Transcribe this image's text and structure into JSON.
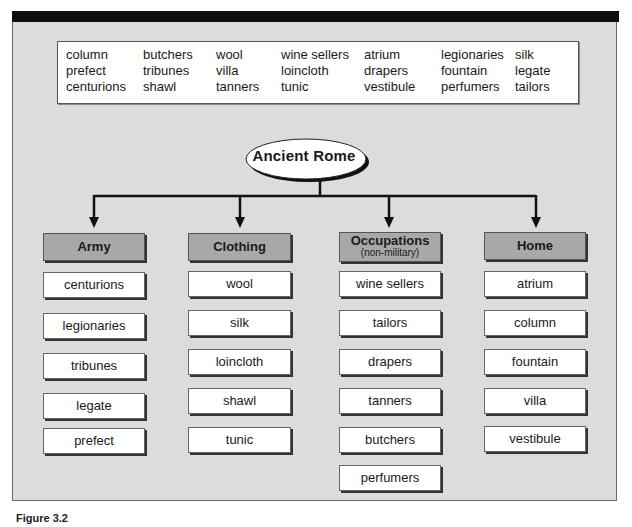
{
  "diagram": {
    "root": {
      "label": "Ancient Rome"
    },
    "word_bank": {
      "columns": [
        [
          "column",
          "prefect",
          "centurions"
        ],
        [
          "butchers",
          "tribunes",
          "shawl"
        ],
        [
          "wool",
          "villa",
          "tanners"
        ],
        [
          "wine sellers",
          "loincloth",
          "tunic"
        ],
        [
          "atrium",
          "drapers",
          "vestibule"
        ],
        [
          "legionaries",
          "fountain",
          "perfumers"
        ],
        [
          "silk",
          "legate",
          "tailors"
        ]
      ]
    },
    "categories": [
      {
        "title": "Army",
        "subtitle": "",
        "items": [
          "centurions",
          "legionaries",
          "tribunes",
          "legate",
          "prefect"
        ]
      },
      {
        "title": "Clothing",
        "subtitle": "",
        "items": [
          "wool",
          "silk",
          "loincloth",
          "shawl",
          "tunic"
        ]
      },
      {
        "title": "Occupations",
        "subtitle": "(non-military)",
        "items": [
          "wine sellers",
          "tailors",
          "drapers",
          "tanners",
          "butchers",
          "perfumers"
        ]
      },
      {
        "title": "Home",
        "subtitle": "",
        "items": [
          "atrium",
          "column",
          "fountain",
          "villa",
          "vestibule"
        ]
      }
    ],
    "caption": "Figure 3.2",
    "colors": {
      "frame_bg": "#dcdcdc",
      "header_bg": "#a8a8a8",
      "item_bg": "#ffffff",
      "top_bar": "#0f0f0f"
    }
  }
}
